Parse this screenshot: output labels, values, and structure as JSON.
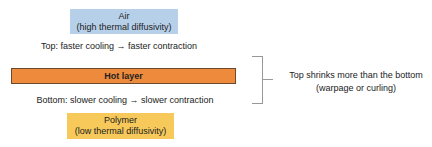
{
  "diagram": {
    "air_box": {
      "title": "Air",
      "subtitle": "(high thermal diffusivity)",
      "color": "#b7d0ea"
    },
    "top_caption": "Top: faster cooling → faster contraction",
    "hot_layer": {
      "label": "Hot layer",
      "color": "#ee8a3c"
    },
    "bottom_caption": "Bottom: slower cooling → slower contraction",
    "polymer_box": {
      "title": "Polymer",
      "subtitle": "(low thermal diffusivity)",
      "color": "#f6c95a"
    },
    "conclusion": {
      "line1": "Top shrinks more than the bottom",
      "line2": "(warpage or curling)"
    }
  }
}
